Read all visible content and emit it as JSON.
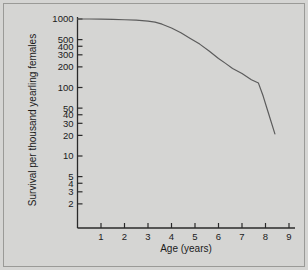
{
  "figure": {
    "background_color": "#d5d5d3",
    "frame_color": "#9a9a97",
    "axis_color": "#2a2a2a",
    "curve_color": "#5c5c5c"
  },
  "chart_data": {
    "type": "line",
    "title": "",
    "xlabel": "Age (years)",
    "ylabel": "Survival per thousand yearling females",
    "xscale": "linear",
    "yscale": "log",
    "xlim": [
      0,
      9.6
    ],
    "ylim": [
      1.7,
      1200
    ],
    "grid": false,
    "legend": false,
    "x_ticks": [
      1,
      2,
      3,
      4,
      5,
      6,
      7,
      8,
      9
    ],
    "x_tick_labels": [
      "1",
      "2",
      "3",
      "4",
      "5",
      "6",
      "7",
      "8",
      "9"
    ],
    "y_ticks": [
      2,
      3,
      4,
      5,
      10,
      20,
      30,
      40,
      50,
      100,
      200,
      300,
      400,
      500,
      1000
    ],
    "y_tick_labels": [
      "2",
      "3",
      "4",
      "5",
      "10",
      "20",
      "30",
      "40",
      "50",
      "100",
      "200",
      "300",
      "400",
      "500",
      "1000"
    ],
    "series": [
      {
        "name": "Survivorship",
        "x": [
          0.0,
          0.5,
          1.0,
          1.5,
          2.0,
          2.5,
          3.0,
          3.3,
          3.6,
          4.0,
          4.4,
          4.8,
          5.2,
          5.6,
          6.0,
          6.3,
          6.6,
          7.0,
          7.4,
          7.7,
          7.9,
          8.1,
          8.4
        ],
        "y": [
          1000,
          1000,
          995,
          985,
          975,
          960,
          930,
          900,
          840,
          740,
          630,
          520,
          430,
          340,
          265,
          225,
          190,
          160,
          130,
          116,
          75,
          45,
          21
        ]
      }
    ]
  },
  "axis_labels": {
    "x_title": "Age (years)",
    "y_title": "Survival per thousand yearling females"
  }
}
